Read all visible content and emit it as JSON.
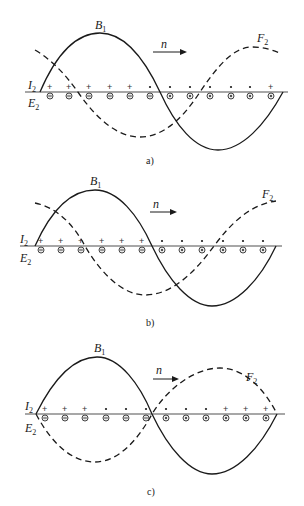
{
  "figure": {
    "panels": [
      {
        "id": "a",
        "caption": "a)",
        "labels": {
          "B": "B",
          "B_sub": "1",
          "F": "F",
          "F_sub": "2",
          "I": "I",
          "I_sub": "2",
          "E": "E",
          "E_sub": "2",
          "n": "n"
        },
        "axis_y": 92,
        "conductor_x": [
          50,
          69,
          89,
          110,
          130,
          150,
          170,
          190,
          210,
          231,
          250,
          271
        ],
        "upper_marks": [
          "+",
          "+",
          "+",
          "+",
          "+",
          "•",
          "•",
          "•",
          "•",
          "•",
          "•",
          "+"
        ],
        "lower_marks": [
          "⊝",
          "⊝",
          "⊝",
          "⊝",
          "⊝",
          "⊝",
          "⊙",
          "⊙",
          "⊙",
          "⊙",
          "⊙",
          "⊙"
        ]
      },
      {
        "id": "b",
        "caption": "b)",
        "labels": {
          "B": "B",
          "B_sub": "1",
          "F": "F",
          "F_sub": "2",
          "I": "I",
          "I_sub": "2",
          "E": "E",
          "E_sub": "2",
          "n": "n"
        },
        "axis_y": 246,
        "conductor_x": [
          41,
          61,
          81,
          102,
          122,
          142,
          162,
          182,
          202,
          223,
          243,
          263
        ],
        "upper_marks": [
          "+",
          "+",
          "+",
          "+",
          "+",
          "+",
          "•",
          "•",
          "•",
          "•",
          "•",
          "•"
        ],
        "lower_marks": [
          "⊝",
          "⊝",
          "⊝",
          "⊝",
          "⊝",
          "⊝",
          "⊙",
          "⊙",
          "⊙",
          "⊙",
          "⊙",
          "⊙"
        ]
      },
      {
        "id": "c",
        "caption": "c)",
        "labels": {
          "B": "B",
          "B_sub": "1",
          "F": "F",
          "F_sub": "2",
          "I": "I",
          "I_sub": "2",
          "E": "E",
          "E_sub": "2",
          "n": "n"
        },
        "axis_y": 414,
        "conductor_x": [
          45,
          65,
          85,
          106,
          126,
          146,
          166,
          186,
          206,
          226,
          246,
          266
        ],
        "upper_marks": [
          "+",
          "+",
          "+",
          "•",
          "•",
          "•",
          "•",
          "•",
          "•",
          "+",
          "+",
          "+"
        ],
        "lower_marks": [
          "⊝",
          "⊝",
          "⊝",
          "⊝",
          "⊝",
          "⊝",
          "⊙",
          "⊙",
          "⊙",
          "⊙",
          "⊙",
          "⊙"
        ]
      }
    ],
    "legend": {
      "solid_curve": "B1 (air-gap flux density wave)",
      "dashed_curve": "F2 (rotor MMF wave)",
      "arrow": "n (direction of rotation)"
    }
  }
}
